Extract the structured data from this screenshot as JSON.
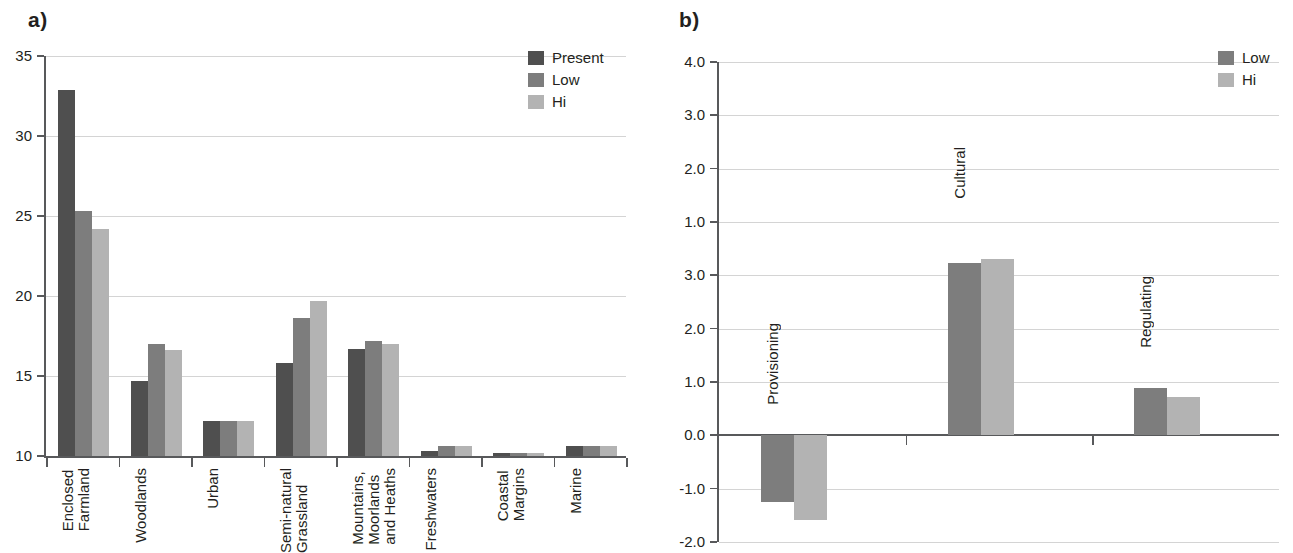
{
  "panels": {
    "a": {
      "letter": "a)",
      "legend": [
        {
          "label": "Present",
          "color": "#4f4f4f"
        },
        {
          "label": "Low",
          "color": "#7d7d7d"
        },
        {
          "label": "Hi",
          "color": "#b3b3b3"
        }
      ]
    },
    "b": {
      "letter": "b)",
      "legend": [
        {
          "label": "Low",
          "color": "#7d7d7d"
        },
        {
          "label": "Hi",
          "color": "#b3b3b3"
        }
      ]
    }
  },
  "chart_data": [
    {
      "type": "bar",
      "panel": "a)",
      "title": "",
      "xlabel": "",
      "ylabel": "",
      "ylim": [
        10,
        35
      ],
      "yticks": [
        "10",
        "15",
        "20",
        "25",
        "30",
        "35"
      ],
      "grid": true,
      "legend_position": "top-right",
      "categories": [
        "Enclosed\nFarmland",
        "Woodlands",
        "Urban",
        "Semi-natural\nGrassland",
        "Mountains,\nMoorlands\nand Heaths",
        "Freshwaters",
        "Coastal\nMargins",
        "Marine"
      ],
      "series": [
        {
          "name": "Present",
          "color": "#4f4f4f",
          "values": [
            32.9,
            14.7,
            12.2,
            15.8,
            16.7,
            10.3,
            10.2,
            10.6
          ]
        },
        {
          "name": "Low",
          "color": "#7d7d7d",
          "values": [
            25.3,
            17.0,
            12.2,
            18.6,
            17.2,
            10.6,
            10.2,
            10.6
          ]
        },
        {
          "name": "Hi",
          "color": "#b3b3b3",
          "values": [
            24.2,
            16.6,
            12.2,
            19.7,
            17.0,
            10.6,
            10.2,
            10.6
          ]
        }
      ]
    },
    {
      "type": "bar",
      "panel": "b)",
      "title": "",
      "xlabel": "",
      "ylabel": "",
      "ylim": [
        -2.0,
        4.0
      ],
      "yticks": [
        "4.0",
        "3.0",
        "2.0",
        "1.0",
        "3.0",
        "2.0",
        "1.0",
        "0.0",
        "-1.0",
        "-2.0"
      ],
      "grid": true,
      "legend_position": "top-right",
      "categories": [
        "Provisioning",
        "Cultural",
        "Regulating"
      ],
      "series": [
        {
          "name": "Low",
          "color": "#7d7d7d",
          "values": [
            -1.25,
            3.23,
            0.88
          ]
        },
        {
          "name": "Hi",
          "color": "#b3b3b3",
          "values": [
            -1.58,
            3.3,
            0.72
          ]
        }
      ]
    }
  ]
}
